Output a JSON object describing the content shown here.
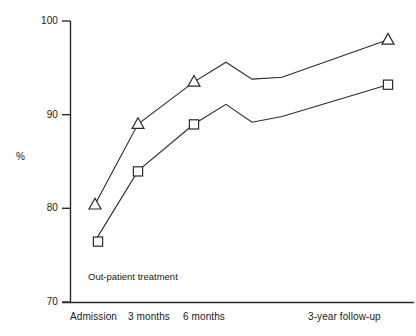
{
  "chart_data": {
    "type": "line",
    "title": "",
    "subtitle": "",
    "xlabel": "",
    "ylabel": "%",
    "ylim": [
      70,
      100
    ],
    "y_ticks": [
      70,
      80,
      90,
      100
    ],
    "y_tick_labels": [
      "70",
      "80",
      "90",
      "100"
    ],
    "grid": false,
    "legend": "none",
    "categories": [
      "Admission",
      "3 months",
      "6 months",
      "3-year follow-up"
    ],
    "x_tick_labels": [
      "Admission",
      "3 months",
      "6 months",
      "3-year follow-up"
    ],
    "annotations": [
      {
        "text": "Out-patient treatment",
        "x_px": 88,
        "y_px": 277
      }
    ],
    "series": [
      {
        "name": "triangle-series",
        "marker": "triangle",
        "marked_points": [
          {
            "category": "Admission",
            "value": 80.4
          },
          {
            "category": "3 months",
            "value": 89.0
          },
          {
            "category": "6 months",
            "value": 93.5
          },
          {
            "category": "3-year follow-up",
            "value": 98.0
          }
        ],
        "path_values": [
          80.4,
          89.0,
          93.5,
          95.6,
          93.8,
          94.0,
          98.0
        ]
      },
      {
        "name": "square-series",
        "marker": "square",
        "marked_points": [
          {
            "category": "Admission",
            "value": 76.5
          },
          {
            "category": "3 months",
            "value": 84.0
          },
          {
            "category": "6 months",
            "value": 89.0
          },
          {
            "category": "3-year follow-up",
            "value": 93.2
          }
        ],
        "path_values": [
          76.5,
          84.0,
          89.0,
          91.1,
          89.2,
          89.8,
          93.2
        ]
      }
    ]
  },
  "axes": {
    "y_labels": [
      "100",
      "90",
      "80",
      "70"
    ],
    "y_axis_title": "%",
    "x_labels": [
      "Admission",
      "3 months",
      "6 months",
      "3-year follow-up"
    ]
  },
  "annotation": {
    "outpatient": "Out-patient treatment"
  },
  "colors": {
    "line": "#2b2b2b",
    "marker_fill": "#ffffff",
    "background": "#ffffff",
    "text": "#1a1a1a"
  }
}
